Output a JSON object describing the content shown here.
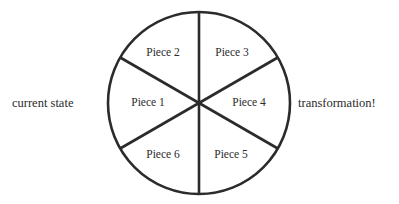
{
  "figure": {
    "background_color": "#ffffff",
    "stroke_color": "#2b2b2b",
    "text_color": "#2b2b2b"
  },
  "side_labels": {
    "left": "current state",
    "right": "transformation!"
  },
  "wheel": {
    "center_x": 199,
    "center_y": 103,
    "radius": 91,
    "stroke_width": 2.6,
    "sector_count": 6,
    "sector_angle_degrees": 60,
    "pieces": [
      {
        "label": "Piece 1",
        "position": "left",
        "label_x": 148,
        "label_y": 103
      },
      {
        "label": "Piece 2",
        "position": "top-left",
        "label_x": 163,
        "label_y": 53
      },
      {
        "label": "Piece 3",
        "position": "top-right",
        "label_x": 232,
        "label_y": 53
      },
      {
        "label": "Piece 4",
        "position": "right",
        "label_x": 249,
        "label_y": 103
      },
      {
        "label": "Piece 5",
        "position": "bottom-right",
        "label_x": 231,
        "label_y": 155
      },
      {
        "label": "Piece 6",
        "position": "bottom-left",
        "label_x": 163,
        "label_y": 155
      }
    ],
    "dividers": [
      {
        "name": "vertical-diameter",
        "angle_degrees": 90
      },
      {
        "name": "diagonal-diameter-up",
        "angle_degrees": 30
      },
      {
        "name": "diagonal-diameter-down",
        "angle_degrees": 150
      }
    ]
  }
}
